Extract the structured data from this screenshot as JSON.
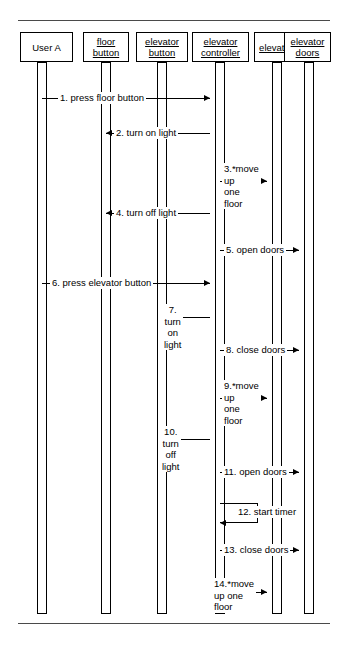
{
  "diagram": {
    "type": "uml-sequence-diagram",
    "stroke_color": "#000000",
    "rule_color": "#4a4a4a",
    "background_color": "#ffffff"
  },
  "objects": [
    {
      "id": "user-a",
      "lines": [
        "User A"
      ],
      "underlined": false,
      "x": 20,
      "y": 32,
      "w": 53,
      "h": 30,
      "lifeline_x": 37
    },
    {
      "id": "floor-button",
      "lines": [
        "floor",
        "button"
      ],
      "underlined": true,
      "x": 83,
      "y": 32,
      "w": 46,
      "h": 30,
      "lifeline_x": 101
    },
    {
      "id": "elevator-button",
      "lines": [
        "elevator",
        "button"
      ],
      "underlined": true,
      "x": 136,
      "y": 32,
      "w": 52,
      "h": 30,
      "lifeline_x": 157
    },
    {
      "id": "elevator-controller",
      "lines": [
        "elevator",
        "controller"
      ],
      "underlined": true,
      "x": 192,
      "y": 32,
      "w": 57,
      "h": 30,
      "lifeline_x": 215
    },
    {
      "id": "elevator",
      "lines": [
        "elevator"
      ],
      "underlined": true,
      "x": 254,
      "y": 32,
      "w": 44,
      "h": 30,
      "lifeline_x": 272
    },
    {
      "id": "elevator-doors",
      "lines": [
        "elevator",
        "doors"
      ],
      "underlined": true,
      "x": 284,
      "y": 32,
      "w": 47,
      "h": 30,
      "lifeline_x": 304
    }
  ],
  "lifeline": {
    "top": 62,
    "bottom": 614,
    "width": 10
  },
  "messages": [
    {
      "n": 1,
      "id": "press-floor-button",
      "label": "1. press floor button",
      "lines": [
        "1. press floor button"
      ],
      "from": "user-a",
      "to": "elevator-controller",
      "direction": "right",
      "x1": 42,
      "x2": 210,
      "y": 98,
      "label_x": 58,
      "label_y": 92,
      "align": "center"
    },
    {
      "n": 2,
      "id": "turn-on-light-floor",
      "label": "2. turn on light",
      "lines": [
        "2. turn on light"
      ],
      "from": "elevator-controller",
      "to": "floor-button",
      "direction": "left",
      "x1": 106,
      "x2": 210,
      "y": 133,
      "label_x": 114,
      "label_y": 127,
      "align": "center"
    },
    {
      "n": 3,
      "id": "move-up-one-floor-1",
      "label": "3.*move up one floor",
      "lines": [
        "3.*move",
        "up",
        "one",
        "floor"
      ],
      "from": "elevator-controller",
      "to": "elevator",
      "direction": "right",
      "x1": 220,
      "x2": 267,
      "y": 181,
      "label_x": 222,
      "label_y": 163,
      "align": "left"
    },
    {
      "n": 4,
      "id": "turn-off-light-floor",
      "label": "4. turn off light",
      "lines": [
        "4. turn off light"
      ],
      "from": "elevator-controller",
      "to": "floor-button",
      "direction": "left",
      "x1": 106,
      "x2": 210,
      "y": 213,
      "label_x": 114,
      "label_y": 207,
      "align": "center"
    },
    {
      "n": 5,
      "id": "open-doors-1",
      "label": "5. open doors",
      "lines": [
        "5. open doors"
      ],
      "from": "elevator-controller",
      "to": "elevator-doors",
      "direction": "right",
      "x1": 220,
      "x2": 299,
      "y": 250,
      "label_x": 224,
      "label_y": 244,
      "align": "center"
    },
    {
      "n": 6,
      "id": "press-elevator-button",
      "label": "6. press elevator button",
      "lines": [
        "6. press elevator button"
      ],
      "from": "user-a",
      "to": "elevator-controller",
      "direction": "right",
      "x1": 42,
      "x2": 210,
      "y": 283,
      "label_x": 50,
      "label_y": 277,
      "align": "center"
    },
    {
      "n": 7,
      "id": "turn-on-light-elevator",
      "label": "7. turn on light",
      "lines": [
        "7. turn",
        "on",
        "light"
      ],
      "from": "elevator-controller",
      "to": "elevator-button",
      "direction": "left",
      "x1": 162,
      "x2": 210,
      "y": 317,
      "label_x": 162,
      "label_y": 304,
      "align": "center"
    },
    {
      "n": 8,
      "id": "close-doors-1",
      "label": "8. close doors",
      "lines": [
        "8. close doors"
      ],
      "from": "elevator-controller",
      "to": "elevator-doors",
      "direction": "right",
      "x1": 220,
      "x2": 299,
      "y": 350,
      "label_x": 224,
      "label_y": 344,
      "align": "center"
    },
    {
      "n": 9,
      "id": "move-up-one-floor-2",
      "label": "9.*move up one floor",
      "lines": [
        "9.*move",
        "up",
        "one",
        "floor"
      ],
      "from": "elevator-controller",
      "to": "elevator",
      "direction": "right",
      "x1": 220,
      "x2": 267,
      "y": 398,
      "label_x": 222,
      "label_y": 380,
      "align": "left"
    },
    {
      "n": 10,
      "id": "turn-off-light-elevator",
      "label": "10. turn off light",
      "lines": [
        "10. turn",
        "off",
        "light"
      ],
      "from": "elevator-controller",
      "to": "elevator-button",
      "direction": "left",
      "x1": 162,
      "x2": 210,
      "y": 439,
      "label_x": 160,
      "label_y": 426,
      "align": "center"
    },
    {
      "n": 11,
      "id": "open-doors-2",
      "label": "11. open doors",
      "lines": [
        "11. open doors"
      ],
      "from": "elevator-controller",
      "to": "elevator-doors",
      "direction": "right",
      "x1": 220,
      "x2": 299,
      "y": 472,
      "label_x": 222,
      "label_y": 466,
      "align": "center"
    },
    {
      "n": 12,
      "id": "start-timer",
      "label": "12. start timer",
      "lines": [
        "12. start timer"
      ],
      "from": "elevator-controller",
      "to": "elevator-controller",
      "direction": "self",
      "x1": 220,
      "x2": 258,
      "y": 503,
      "y2": 523,
      "label_x": 236,
      "label_y": 506,
      "align": "left"
    },
    {
      "n": 13,
      "id": "close-doors-2",
      "label": "13. close doors",
      "lines": [
        "13. close doors"
      ],
      "from": "elevator-controller",
      "to": "elevator-doors",
      "direction": "right",
      "x1": 220,
      "x2": 299,
      "y": 550,
      "label_x": 222,
      "label_y": 544,
      "align": "center"
    },
    {
      "n": 14,
      "id": "move-up-one-floor-3",
      "label": "14.*move up one floor",
      "lines": [
        "14.*move",
        "up one",
        "floor"
      ],
      "from": "elevator-controller",
      "to": "elevator",
      "direction": "right",
      "x1": 220,
      "x2": 267,
      "y": 592,
      "label_x": 212,
      "label_y": 578,
      "align": "left"
    }
  ]
}
